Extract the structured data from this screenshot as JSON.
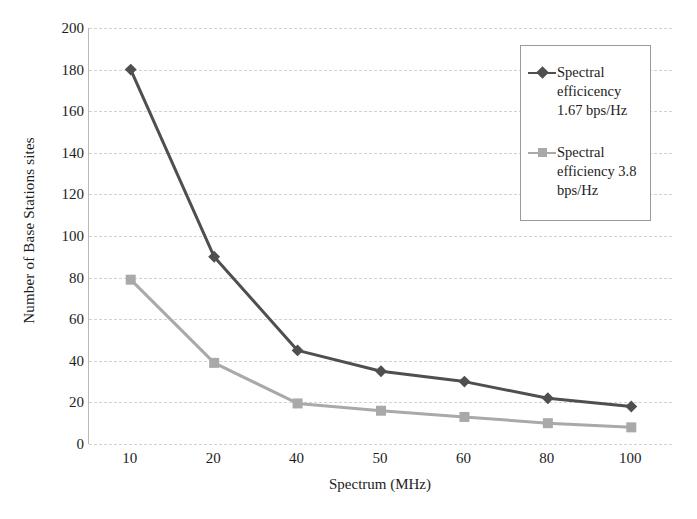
{
  "chart_data": {
    "type": "line",
    "title": "",
    "xlabel": "Spectrum (MHz)",
    "ylabel": "Number of Base Stations sites",
    "categories": [
      10,
      20,
      40,
      50,
      60,
      80,
      100
    ],
    "xtick_labels": [
      "10",
      "20",
      "40",
      "50",
      "60",
      "80",
      "100"
    ],
    "ytick_labels": [
      "0",
      "20",
      "40",
      "60",
      "80",
      "100",
      "120",
      "140",
      "160",
      "180",
      "200"
    ],
    "yticks": [
      0,
      20,
      40,
      60,
      80,
      100,
      120,
      140,
      160,
      180,
      200
    ],
    "ylim": [
      0,
      200
    ],
    "grid": true,
    "legend_position": "top-right",
    "series": [
      {
        "name": "Spectral efficicency 1.67 bps/Hz",
        "color": "#4f4f4f",
        "marker": "diamond",
        "values": [
          180,
          90,
          45,
          35,
          30,
          22,
          18
        ]
      },
      {
        "name": "Spectral efficiency 3.8 bps/Hz",
        "color": "#a9a9a9",
        "marker": "square",
        "values": [
          79,
          39,
          19.5,
          16,
          13,
          10,
          8
        ]
      }
    ]
  },
  "legend": {
    "entries": [
      {
        "label": "Spectral\nefficicency\n1.67 bps/Hz"
      },
      {
        "label": "Spectral\nefficiency 3.8\nbps/Hz"
      }
    ]
  },
  "axes": {
    "x_title": "Spectrum (MHz)",
    "y_title": "Number of Base Stations sites"
  },
  "colors": {
    "series_1": "#4f4f4f",
    "series_2": "#a9a9a9",
    "gridline": "#d2d2d2",
    "axis": "#b9b9b9",
    "text": "#1c1c1c",
    "background": "#ffffff"
  }
}
